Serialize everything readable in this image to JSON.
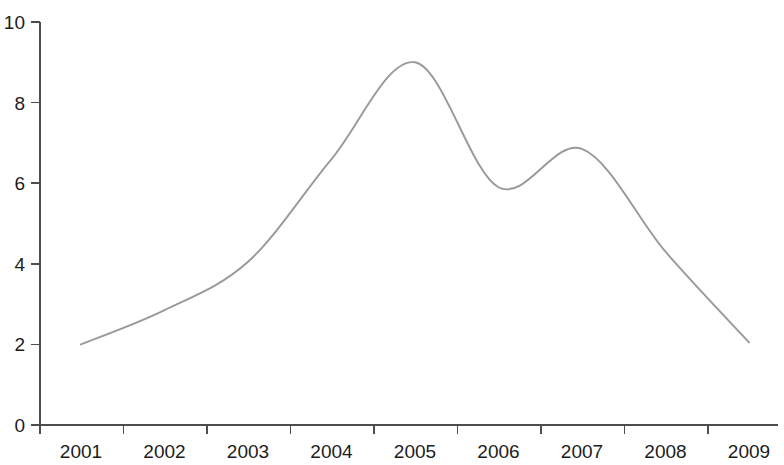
{
  "chart_data": {
    "type": "line",
    "title": "",
    "subtitle": "",
    "xlabel": "",
    "ylabel": "",
    "grid": false,
    "legend": false,
    "legend_position": "none",
    "xlim": [
      2000.5,
      2009.5
    ],
    "ylim": [
      0,
      10
    ],
    "x_tick_labels": [
      "2001",
      "2002",
      "2003",
      "2004",
      "2005",
      "2006",
      "2007",
      "2008",
      "2009"
    ],
    "y_tick_labels": [
      "0",
      "2",
      "4",
      "6",
      "8",
      "10"
    ],
    "y_ticks": [
      0,
      2,
      4,
      6,
      8,
      10
    ],
    "series": [
      {
        "name": "Series 1",
        "color": "#999999",
        "x": [
          2001,
          2002,
          2003,
          2004,
          2005,
          2006,
          2007,
          2008,
          2009
        ],
        "values": [
          2.0,
          2.85,
          4.05,
          6.6,
          9.0,
          5.9,
          6.85,
          4.3,
          2.05
        ]
      }
    ],
    "annotations": []
  },
  "figure": {
    "background_color": "#ffffff",
    "axis_color": "#4d4d4d",
    "text_color": "#1c1c1c",
    "series_color": "#999999"
  }
}
